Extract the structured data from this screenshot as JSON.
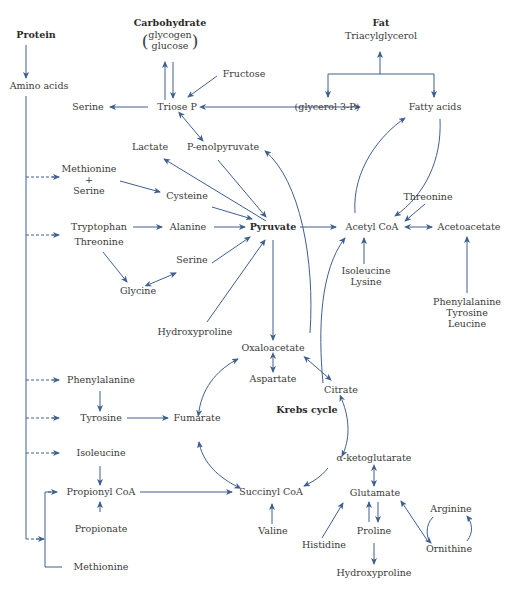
{
  "colors": {
    "arrow": "#3f5f8f",
    "text": "#3a3a3a",
    "background": "#ffffff"
  },
  "headers": {
    "protein": "Protein",
    "carbohydrate": "Carbohydrate",
    "fat": "Fat",
    "krebs": "Krebs cycle"
  },
  "carbohydrate_forms": {
    "line1": "glycogen",
    "line2": "glucose",
    "open": "(",
    "close": ")"
  },
  "nodes": {
    "triacylglycerol": "Triacylglycerol",
    "amino_acids": "Amino acids",
    "fructose": "Fructose",
    "serine_top": "Serine",
    "triose_p": "Triose P",
    "glycerol_3p": "(glycerol 3-P)",
    "fatty_acids": "Fatty acids",
    "lactate": "Lactate",
    "p_enolpyruvate": "P-enolpyruvate",
    "methionine_serine": {
      "line1": "Methionine",
      "line2": "+",
      "line3": "Serine"
    },
    "cysteine": "Cysteine",
    "threonine_right": "Threonine",
    "tryptophan": "Tryptophan",
    "alanine": "Alanine",
    "pyruvate": "Pyruvate",
    "acetyl_coa": "Acetyl CoA",
    "acetoacetate": "Acetoacetate",
    "threonine_left": "Threonine",
    "serine_mid": "Serine",
    "glycine": "Glycine",
    "isoleucine_lysine": {
      "line1": "Isoleucine",
      "line2": "Lysine"
    },
    "phe_tyr_leu": {
      "line1": "Phenylalanine",
      "line2": "Tyrosine",
      "line3": "Leucine"
    },
    "hydroxyproline_mid": "Hydroxyproline",
    "oxaloacetate": "Oxaloacetate",
    "aspartate": "Aspartate",
    "citrate": "Citrate",
    "phenylalanine": "Phenylalanine",
    "tyrosine": "Tyrosine",
    "fumarate": "Fumarate",
    "isoleucine": "Isoleucine",
    "alpha_ketoglutarate": "α-ketoglutarate",
    "propionyl_coa": "Propionyl CoA",
    "succinyl_coa": "Succinyl CoA",
    "glutamate": "Glutamate",
    "arginine": "Arginine",
    "propionate": "Propionate",
    "valine": "Valine",
    "histidine": "Histidine",
    "proline": "Proline",
    "ornithine": "Ornithine",
    "methionine_bottom": "Methionine",
    "hydroxyproline_bottom": "Hydroxyproline"
  }
}
